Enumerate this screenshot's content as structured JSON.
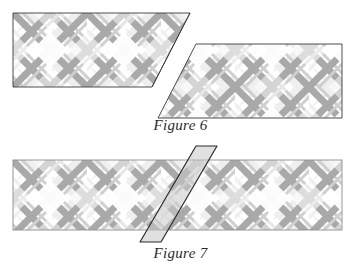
{
  "page": {
    "background": "#ffffff",
    "width": 361,
    "height": 273,
    "kind": "geometry-figure-illustration"
  },
  "palette": {
    "band_fill": "#ffffff",
    "outline": "#3a3a3a",
    "stripe_dark": "#a8a8a8",
    "stripe_mid": "#c6c6c6",
    "stripe_light": "#e2e2e2",
    "stripe_pale": "#f1f1f1",
    "overlay_fill": "#cfcfcf",
    "caption_color": "#2b2b2b"
  },
  "figure6": {
    "caption": "Figure 6",
    "name": "figure-6",
    "description": "Two plaid-patterned parallelogram bands cut along a common diagonal and offset from one another",
    "upper_band": {
      "name": "upper-parallelogram-band",
      "points": "13,13 190,13 152,87 13,87",
      "top_y": 13,
      "bottom_y": 87,
      "left_x": 13,
      "height": 74
    },
    "lower_band": {
      "name": "lower-parallelogram-band",
      "points": "196,44 342,44 342,118 158,118",
      "top_y": 44,
      "bottom_y": 118,
      "right_x": 342,
      "height": 74
    },
    "cut_line": {
      "name": "diagonal-cut-edge",
      "slope_label": "down-left diagonal",
      "from": "190,13",
      "to": "152,87"
    }
  },
  "figure7": {
    "caption": "Figure 7",
    "name": "figure-7",
    "description": "A single plaid-patterned rectangular band with a narrow shaded diagonal strip laid across it, its two ends protruding past the band edges",
    "band": {
      "name": "rectangular-band",
      "points": "13,160 342,160 342,230 13,230",
      "top_y": 160,
      "bottom_y": 230,
      "left_x": 13,
      "right_x": 342,
      "height": 70
    },
    "overlay_strip": {
      "name": "diagonal-overlay-strip",
      "points": "196,146 217,146 161,242 140,242",
      "fill": "#cfcfcf",
      "outline": "#2b2b2b",
      "top_tip_above_band": true,
      "bottom_tip_below_band": true
    }
  },
  "pattern": {
    "name": "plaid-lattice",
    "description": "Diagonal stripes running at plus and minus 45 degrees crossing to form a diamond lattice",
    "period_px": 74,
    "stripe_angles_deg": [
      45,
      -45
    ],
    "stripe_widths_px": [
      9,
      4,
      22,
      3
    ]
  }
}
